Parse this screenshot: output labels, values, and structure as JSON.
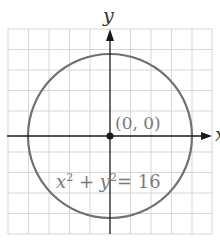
{
  "figure": {
    "y_axis_label": "y",
    "x_axis_label": "x",
    "origin_label": "(0, 0)",
    "equation": {
      "x": "x",
      "exp1": "2",
      "plus": "+",
      "y": "y",
      "exp2": "2",
      "equals": "=",
      "value": "16"
    },
    "circle": {
      "center": [
        0,
        0
      ],
      "radius": 4
    },
    "grid": {
      "x_range": [
        -5,
        5
      ],
      "y_range": [
        -5,
        5
      ],
      "step": 1
    },
    "colors": {
      "grid": "#d4d4d4",
      "axis": "#1a1a1a",
      "circle": "#6e6e6e",
      "label": "#7a7a7a"
    }
  }
}
